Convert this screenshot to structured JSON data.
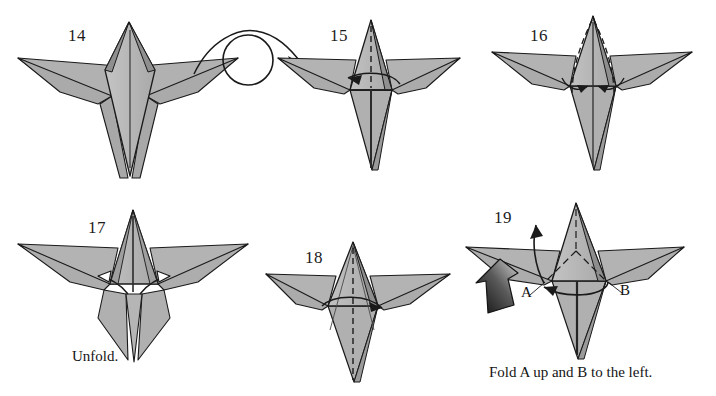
{
  "document": {
    "kind": "origami-instruction-diagram",
    "background_color": "#ffffff",
    "paper_fill_color": "#b1b1b1",
    "paper_fill_light": "#c6c6c6",
    "paper_fill_dark": "#9d9d9d",
    "line_color": "#1a1a1a"
  },
  "steps": [
    {
      "id": "step-14",
      "number": "14",
      "number_pos": {
        "x": 68,
        "y": 26
      },
      "caption": "",
      "annotations": [
        "center-line",
        "turn-over-arrow"
      ]
    },
    {
      "id": "step-15",
      "number": "15",
      "number_pos": {
        "x": 330,
        "y": 26
      },
      "caption": "",
      "annotations": [
        "dashed-center-line",
        "curved-arrow-left"
      ]
    },
    {
      "id": "step-16",
      "number": "16",
      "number_pos": {
        "x": 530,
        "y": 26
      },
      "caption": "",
      "annotations": [
        "two-dashed-fold-lines",
        "two-inward-arrows"
      ]
    },
    {
      "id": "step-17",
      "number": "17",
      "number_pos": {
        "x": 88,
        "y": 218
      },
      "caption": "Unfold.",
      "caption_pos": {
        "x": 72,
        "y": 348
      },
      "annotations": [
        "hollow-unfold-arrows"
      ]
    },
    {
      "id": "step-18",
      "number": "18",
      "number_pos": {
        "x": 305,
        "y": 248
      },
      "caption": "",
      "annotations": [
        "dashed-center-line",
        "curved-arrow-right"
      ]
    },
    {
      "id": "step-19",
      "number": "19",
      "number_pos": {
        "x": 494,
        "y": 208
      },
      "caption": "Fold A up and B to the left.",
      "caption_pos": {
        "x": 489,
        "y": 365
      },
      "annotations": [
        "dash-dot-fold-lines",
        "arrow-up",
        "curved-arrow-left",
        "push-here-arrow",
        "label-A",
        "label-B"
      ],
      "point_labels": [
        {
          "text": "A",
          "x": 527,
          "y": 288
        },
        {
          "text": "B",
          "x": 621,
          "y": 286
        }
      ]
    }
  ],
  "icons": {
    "turn_over": "turn-over-arrow-icon",
    "unfold": "hollow-arrow-icon",
    "push": "push-here-arrow-icon",
    "valley_fold": "dashed-line-icon",
    "fold_direction": "curved-arrow-icon"
  }
}
